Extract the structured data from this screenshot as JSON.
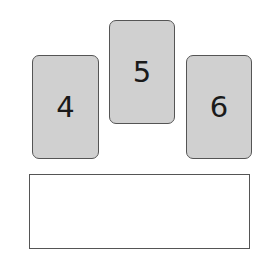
{
  "cards": [
    {
      "label": "4"
    },
    {
      "label": "5"
    },
    {
      "label": "6"
    }
  ],
  "answer_box": {
    "value": ""
  },
  "colors": {
    "card_fill": "#d0d0d0",
    "card_border": "#555555",
    "digit": "#1a1a1a",
    "box_border": "#555555",
    "background": "#ffffff"
  }
}
